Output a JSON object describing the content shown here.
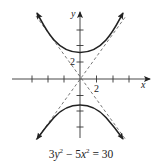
{
  "figure": {
    "type": "hyperbola-graph",
    "equation": {
      "coef_y": "3",
      "var_y": "y",
      "exp": "2",
      "minus": "−",
      "coef_x": "5",
      "var_x": "x",
      "equals": "=",
      "rhs": "30"
    },
    "axes": {
      "x_label": "x",
      "y_label": "y",
      "x_tick_label": "2",
      "y_tick_label": "2",
      "tick_step": 2,
      "x_ticks": [
        -6,
        -4,
        -2,
        2,
        4,
        6
      ],
      "y_ticks": [
        -6,
        -4,
        -2,
        2,
        4,
        6
      ]
    },
    "curve": {
      "description": "Hyperbola opening up and down, vertices (0, ±√10)",
      "vertices": [
        [
          0,
          3.16
        ],
        [
          0,
          -3.16
        ]
      ],
      "asymptotes": [
        "y = √(5/3) x",
        "y = −√(5/3) x"
      ],
      "asymptote_style": "dashed",
      "color": "#222222"
    }
  }
}
